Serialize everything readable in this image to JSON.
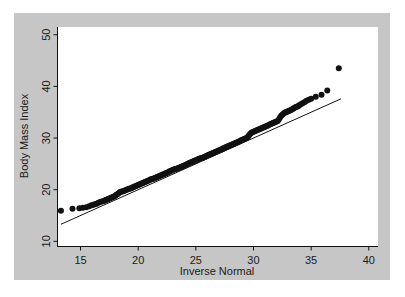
{
  "figure": {
    "background_color": "#ffffff",
    "panel_color": "#c6c6c6",
    "plot_area_color": "#ffffff",
    "ink_color": "#111111"
  },
  "chart_data": {
    "type": "scatter",
    "title": "",
    "subtitle": "",
    "xlabel": "Inverse Normal",
    "ylabel": "Body Mass Index",
    "xlim": [
      13.0,
      40.8
    ],
    "ylim": [
      9.0,
      51.5
    ],
    "xticks": [
      15,
      20,
      25,
      30,
      35,
      40
    ],
    "xticklabels": [
      "15",
      "20",
      "25",
      "30",
      "35",
      "40"
    ],
    "yticks": [
      10,
      20,
      30,
      40,
      50
    ],
    "yticklabels": [
      "10",
      "20",
      "30",
      "40",
      "50"
    ],
    "grid": false,
    "legend": false,
    "legend_position": "none",
    "annotations": [],
    "series": [
      {
        "name": "Q-Q points",
        "type": "scatter",
        "marker": "filled-circle",
        "marker_size": 3.0,
        "color": "#111111",
        "x": [
          13.3,
          14.3,
          14.9,
          15.2,
          15.5,
          15.75,
          15.95,
          16.1,
          16.25,
          16.4,
          16.55,
          16.7,
          16.85,
          17.0,
          17.1,
          17.2,
          17.3,
          17.4,
          17.5,
          17.6,
          17.7,
          17.8,
          17.9,
          18.0,
          18.1,
          18.2,
          18.3,
          18.4,
          18.5,
          18.6,
          18.7,
          18.8,
          18.9,
          19.0,
          19.1,
          19.2,
          19.3,
          19.4,
          19.5,
          19.6,
          19.7,
          19.8,
          19.9,
          20.0,
          20.1,
          20.2,
          20.3,
          20.4,
          20.5,
          20.6,
          20.7,
          20.8,
          20.9,
          21.0,
          21.1,
          21.2,
          21.3,
          21.4,
          21.5,
          21.6,
          21.7,
          21.8,
          21.9,
          22.0,
          22.1,
          22.2,
          22.3,
          22.4,
          22.5,
          22.6,
          22.7,
          22.8,
          22.9,
          23.0,
          23.1,
          23.2,
          23.3,
          23.4,
          23.5,
          23.6,
          23.7,
          23.8,
          23.9,
          24.0,
          24.1,
          24.2,
          24.3,
          24.4,
          24.5,
          24.6,
          24.7,
          24.8,
          24.9,
          25.0,
          25.1,
          25.2,
          25.3,
          25.4,
          25.5,
          25.6,
          25.7,
          25.8,
          25.9,
          26.0,
          26.1,
          26.2,
          26.3,
          26.4,
          26.5,
          26.6,
          26.7,
          26.8,
          26.9,
          27.0,
          27.1,
          27.2,
          27.3,
          27.4,
          27.5,
          27.6,
          27.7,
          27.8,
          27.9,
          28.0,
          28.1,
          28.2,
          28.3,
          28.4,
          28.5,
          28.6,
          28.7,
          28.8,
          28.9,
          29.0,
          29.1,
          29.2,
          29.3,
          29.4,
          29.5,
          29.6,
          29.7,
          29.8,
          29.9,
          30.0,
          30.1,
          30.2,
          30.3,
          30.4,
          30.5,
          30.6,
          30.7,
          30.8,
          30.9,
          31.0,
          31.1,
          31.2,
          31.3,
          31.4,
          31.5,
          31.6,
          31.7,
          31.8,
          31.9,
          32.0,
          32.1,
          32.2,
          32.3,
          32.4,
          32.5,
          32.6,
          32.7,
          32.8,
          32.9,
          33.0,
          33.1,
          33.2,
          33.3,
          33.4,
          33.5,
          33.6,
          33.7,
          33.8,
          33.9,
          34.0,
          34.15,
          34.3,
          34.45,
          34.6,
          34.8,
          35.0,
          35.4,
          35.9,
          36.4,
          37.4
        ],
        "y": [
          15.9,
          16.3,
          16.4,
          16.5,
          16.6,
          16.8,
          17.0,
          17.1,
          17.2,
          17.3,
          17.45,
          17.6,
          17.7,
          17.8,
          17.9,
          18.0,
          18.1,
          18.2,
          18.3,
          18.4,
          18.5,
          18.6,
          18.7,
          18.8,
          19.0,
          19.1,
          19.3,
          19.5,
          19.6,
          19.65,
          19.7,
          19.8,
          19.9,
          20.0,
          20.1,
          20.2,
          20.25,
          20.3,
          20.4,
          20.5,
          20.6,
          20.7,
          20.8,
          20.9,
          21.0,
          21.1,
          21.2,
          21.3,
          21.4,
          21.5,
          21.6,
          21.7,
          21.8,
          21.9,
          22.0,
          22.05,
          22.1,
          22.2,
          22.3,
          22.4,
          22.5,
          22.6,
          22.7,
          22.8,
          22.9,
          23.0,
          23.1,
          23.2,
          23.3,
          23.4,
          23.5,
          23.6,
          23.7,
          23.8,
          23.9,
          24.0,
          24.05,
          24.1,
          24.2,
          24.3,
          24.4,
          24.5,
          24.6,
          24.7,
          24.8,
          24.9,
          25.0,
          25.1,
          25.2,
          25.3,
          25.4,
          25.5,
          25.6,
          25.7,
          25.8,
          25.9,
          26.0,
          26.1,
          26.15,
          26.2,
          26.3,
          26.4,
          26.5,
          26.6,
          26.7,
          26.8,
          26.9,
          27.0,
          27.1,
          27.2,
          27.3,
          27.4,
          27.5,
          27.6,
          27.7,
          27.8,
          27.9,
          28.0,
          28.1,
          28.2,
          28.3,
          28.4,
          28.5,
          28.6,
          28.7,
          28.8,
          28.9,
          29.0,
          29.1,
          29.2,
          29.3,
          29.4,
          29.5,
          29.6,
          29.7,
          29.8,
          29.9,
          30.0,
          30.2,
          30.5,
          30.8,
          31.0,
          31.1,
          31.2,
          31.3,
          31.4,
          31.5,
          31.6,
          31.7,
          31.8,
          31.9,
          32.0,
          32.1,
          32.2,
          32.3,
          32.4,
          32.5,
          32.6,
          32.7,
          32.8,
          32.9,
          33.0,
          33.1,
          33.2,
          33.3,
          33.6,
          34.0,
          34.3,
          34.5,
          34.7,
          34.9,
          35.0,
          35.1,
          35.2,
          35.3,
          35.4,
          35.5,
          35.6,
          35.75,
          35.9,
          36.0,
          36.1,
          36.2,
          36.4,
          36.6,
          36.8,
          37.0,
          37.2,
          37.4,
          37.6,
          38.0,
          38.4,
          39.2,
          43.5
        ]
      },
      {
        "name": "reference line",
        "type": "line",
        "color": "#111111",
        "linewidth": 1,
        "x": [
          13.3,
          37.6
        ],
        "y": [
          13.3,
          37.6
        ]
      }
    ]
  }
}
